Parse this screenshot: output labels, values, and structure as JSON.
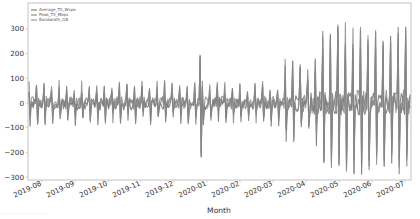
{
  "chart_data": {
    "type": "line",
    "title": "",
    "xlabel": "Month",
    "ylabel": "",
    "ylim": [
      -320,
      350
    ],
    "yticks": [
      300,
      200,
      100,
      0,
      -100,
      -200,
      -300
    ],
    "xticks": [
      "2019-08",
      "2019-09",
      "2019-10",
      "2019-11",
      "2019-12",
      "2020-01",
      "2020-02",
      "2020-03",
      "2020-04",
      "2020-05",
      "2020-06",
      "2020-07"
    ],
    "x_range": [
      "2019-07-26",
      "2020-07-14"
    ],
    "grid": false,
    "legend_position": "upper left",
    "series": [
      {
        "name": "Average_TX_Wspe",
        "color": "#6e6e6e"
      },
      {
        "name": "Peak_TX_Mbps",
        "color": "#7a7a7a"
      },
      {
        "name": "Bandwidth_GB",
        "color": "#888888"
      }
    ],
    "segments": [
      {
        "from": "2019-07-26",
        "to": "2020-03-15",
        "amplitude": 70
      },
      {
        "from": "2019-12-30",
        "to": "2020-01-01",
        "peak": 190,
        "trough": -215
      },
      {
        "from": "2020-03-15",
        "to": "2020-04-20",
        "amplitude": 160
      },
      {
        "from": "2020-04-20",
        "to": "2020-07-14",
        "amplitude": 320
      }
    ]
  },
  "caption": "...................................."
}
